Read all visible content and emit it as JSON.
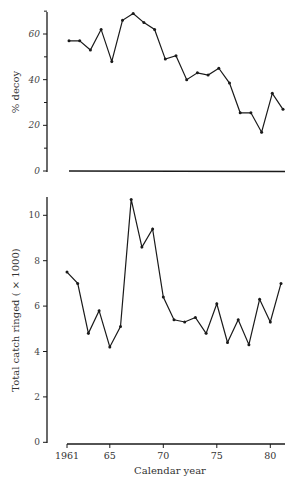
{
  "chart_data": [
    {
      "type": "line",
      "title": "",
      "xlabel": "",
      "ylabel": "% decoy",
      "ylim": [
        0,
        70
      ],
      "yticks": [
        0,
        20,
        40,
        60
      ],
      "minor_yticks": [
        10,
        30,
        50,
        70
      ],
      "x": [
        1961,
        1962,
        1963,
        1964,
        1965,
        1966,
        1967,
        1968,
        1969,
        1970,
        1971,
        1972,
        1973,
        1974,
        1975,
        1976,
        1977,
        1978,
        1979,
        1980,
        1981
      ],
      "values": [
        57,
        57,
        53,
        62,
        48,
        66,
        69,
        65,
        62,
        49,
        50.5,
        40,
        43,
        42,
        45,
        38.5,
        25.5,
        25.5,
        17,
        34,
        27
      ],
      "baseline_at_zero": true,
      "grid": false
    },
    {
      "type": "line",
      "title": "",
      "xlabel": "Calendar year",
      "ylabel": "Total catch ringed ( × 1000)",
      "ylim": [
        0,
        10.8
      ],
      "yticks": [
        0,
        2,
        4,
        6,
        8,
        10
      ],
      "xticks": [
        1961,
        1965,
        1970,
        1975,
        1980
      ],
      "xtick_labels": [
        "1961",
        "65",
        "70",
        "75",
        "80"
      ],
      "x": [
        1961,
        1962,
        1963,
        1964,
        1965,
        1966,
        1967,
        1968,
        1969,
        1970,
        1971,
        1972,
        1973,
        1974,
        1975,
        1976,
        1977,
        1978,
        1979,
        1980,
        1981
      ],
      "values": [
        7.5,
        7.0,
        4.8,
        5.8,
        4.2,
        5.1,
        10.7,
        8.6,
        9.4,
        6.4,
        5.4,
        5.3,
        5.5,
        4.8,
        6.1,
        4.4,
        5.4,
        4.3,
        6.3,
        5.3,
        7.0
      ],
      "grid": false
    }
  ],
  "labels": {
    "top_ylabel": "% decoy",
    "bottom_ylabel": "Total catch ringed ( × 1000)",
    "xlabel": "Calendar year"
  }
}
